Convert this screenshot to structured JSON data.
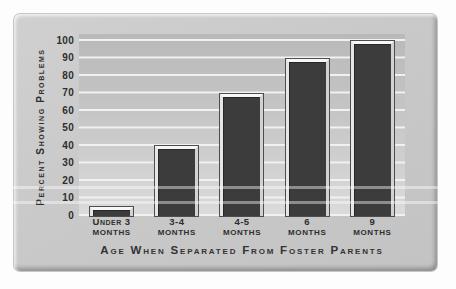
{
  "figure": {
    "y_axis_title": "Percent Showing Problems",
    "x_axis_title": "Age When Separated From Foster Parents",
    "y_ticks": [
      "100",
      "90",
      "80",
      "70",
      "60",
      "50",
      "40",
      "30",
      "20",
      "10",
      "0"
    ],
    "categories": [
      {
        "line1": "Under 3",
        "line2": "Months"
      },
      {
        "line1": "3-4",
        "line2": "Months"
      },
      {
        "line1": "4-5",
        "line2": "Months"
      },
      {
        "line1": "6",
        "line2": "Months"
      },
      {
        "line1": "9",
        "line2": "Months"
      }
    ],
    "bar_color": "#3c3c3c",
    "panel_color": "#c9c9c9",
    "gridline_color": "#f2f2f2",
    "text_color": "#2e2e2e"
  },
  "chart_data": {
    "type": "bar",
    "categories": [
      "Under 3 Months",
      "3-4 Months",
      "4-5 Months",
      "6 Months",
      "9 Months"
    ],
    "values": [
      5,
      40,
      70,
      90,
      100
    ],
    "title": "",
    "xlabel": "Age When Separated From Foster Parents",
    "ylabel": "Percent Showing Problems",
    "ylim": [
      0,
      100
    ],
    "ytick_step": 10,
    "grid": "horizontal-gridlines-with-gray-bands",
    "legend": "none",
    "bar_color": "#3c3c3c"
  }
}
